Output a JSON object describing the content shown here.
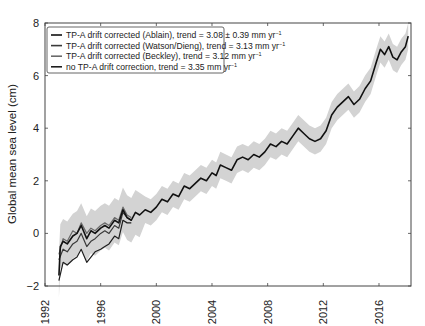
{
  "chart_data": {
    "type": "line",
    "title": "",
    "xlabel": "",
    "ylabel": "Global mean sea level (cm)",
    "xlim": [
      1992,
      2018.3
    ],
    "ylim": [
      -2,
      8
    ],
    "xticks": [
      1992,
      1996,
      2000,
      2004,
      2008,
      2012,
      2016
    ],
    "yticks": [
      -2,
      0,
      2,
      4,
      6,
      8
    ],
    "grid": false,
    "legend_position": "upper left",
    "series": [
      {
        "name": "TP-A drift corrected (Ablain), trend = 3.08 ± 0.39 mm yr⁻¹",
        "color": "#111111",
        "x": [
          1993.0,
          1993.1,
          1993.3,
          1993.6,
          1994.0,
          1994.3,
          1994.6,
          1995.0,
          1995.3,
          1995.6,
          1996.0,
          1996.3,
          1996.6,
          1997.0,
          1997.3,
          1997.6,
          1997.9,
          1998.2,
          1998.5,
          1998.8,
          1999.2,
          1999.6,
          2000.0,
          2000.4,
          2000.8,
          2001.2,
          2001.6,
          2002.0,
          2002.4,
          2002.8,
          2003.2,
          2003.6,
          2004.0,
          2004.3,
          2004.6,
          2005.0,
          2005.4,
          2005.8,
          2006.2,
          2006.6,
          2007.0,
          2007.4,
          2007.8,
          2008.2,
          2008.6,
          2009.0,
          2009.4,
          2009.8,
          2010.2,
          2010.6,
          2011.0,
          2011.4,
          2011.8,
          2012.2,
          2012.6,
          2013.0,
          2013.4,
          2013.8,
          2014.2,
          2014.6,
          2015.0,
          2015.4,
          2015.8,
          2016.1,
          2016.4,
          2016.7,
          2017.0,
          2017.3,
          2017.6,
          2017.9,
          2018.1
        ],
        "values": [
          -1.6,
          -0.5,
          -0.3,
          -0.4,
          -0.1,
          0.0,
          0.3,
          -0.2,
          0.1,
          0.0,
          0.2,
          0.3,
          0.2,
          0.5,
          0.4,
          0.9,
          0.6,
          0.5,
          0.8,
          0.7,
          0.9,
          0.8,
          1.0,
          1.3,
          1.2,
          1.5,
          1.4,
          1.8,
          1.7,
          1.9,
          2.1,
          2.0,
          2.3,
          2.2,
          2.6,
          2.5,
          2.4,
          2.8,
          2.9,
          2.8,
          3.0,
          2.9,
          3.1,
          3.4,
          3.3,
          3.5,
          3.4,
          3.7,
          4.0,
          3.8,
          3.6,
          3.5,
          3.6,
          3.9,
          4.5,
          4.8,
          5.0,
          5.2,
          4.9,
          5.1,
          5.5,
          5.8,
          6.5,
          7.0,
          6.8,
          7.1,
          6.7,
          6.6,
          6.9,
          7.1,
          7.5
        ],
        "uncertainty_band_cm": 0.5
      },
      {
        "name": "TP-A drift corrected (Watson/Dieng), trend = 3.13 mm yr⁻¹",
        "color": "#3a3a3a",
        "x": [
          1993.0,
          1993.3,
          1993.6,
          1994.0,
          1994.3,
          1994.6,
          1995.0,
          1995.3,
          1995.6,
          1996.0,
          1996.3,
          1996.6,
          1997.0,
          1997.3,
          1997.6,
          1997.9,
          1998.2
        ],
        "values": [
          -1.0,
          -0.6,
          -0.7,
          -0.4,
          -0.3,
          0.0,
          -0.5,
          -0.3,
          -0.2,
          0.0,
          0.1,
          0.0,
          0.3,
          0.2,
          0.8,
          0.6,
          0.5
        ]
      },
      {
        "name": "TP-A drift corrected (Beckley), trend = 3.12 mm yr⁻¹",
        "color": "#6a6a6a",
        "x": [
          1993.0,
          1993.3,
          1993.6,
          1994.0,
          1994.3,
          1994.6,
          1995.0,
          1995.3,
          1995.6,
          1996.0,
          1996.3,
          1996.6,
          1997.0,
          1997.3,
          1997.6,
          1997.9,
          1998.2
        ],
        "values": [
          -0.8,
          -0.2,
          -0.3,
          0.1,
          0.0,
          0.4,
          0.0,
          0.2,
          0.1,
          0.3,
          0.4,
          0.3,
          0.6,
          0.5,
          1.0,
          0.7,
          0.6
        ]
      },
      {
        "name": "no TP-A drift correction, trend = 3.35 mm yr⁻¹",
        "color": "#1e1e1e",
        "x": [
          1993.0,
          1993.3,
          1993.6,
          1994.0,
          1994.3,
          1994.6,
          1995.0,
          1995.3,
          1995.6,
          1996.0,
          1996.3,
          1996.6,
          1997.0,
          1997.3,
          1997.6,
          1997.9,
          1998.2
        ],
        "values": [
          -1.8,
          -1.1,
          -1.2,
          -1.0,
          -0.9,
          -0.6,
          -1.1,
          -0.9,
          -0.7,
          -0.6,
          -0.5,
          -0.4,
          -0.1,
          -0.2,
          0.5,
          0.4,
          0.4
        ]
      }
    ],
    "legend": [
      "TP-A drift corrected (Ablain), trend = 3.08 ± 0.39 mm yr⁻¹",
      "TP-A drift corrected (Watson/Dieng), trend = 3.13 mm yr⁻¹",
      "TP-A drift corrected (Beckley), trend = 3.12 mm yr⁻¹",
      "no TP-A drift correction, trend = 3.35 mm yr⁻¹"
    ]
  },
  "axes": {
    "ylabel": "Global mean sea level (cm)",
    "xtick_labels": [
      "1992",
      "1996",
      "2000",
      "2004",
      "2008",
      "2012",
      "2016"
    ],
    "ytick_labels": [
      "−2",
      "0",
      "2",
      "4",
      "6",
      "8"
    ]
  },
  "legend": {
    "items": [
      {
        "label": "TP-A drift corrected (Ablain), trend = 3.08 ± 0.39 mm yr",
        "sup": "−1",
        "color": "#111111"
      },
      {
        "label": "TP-A drift corrected (Watson/Dieng), trend = 3.13 mm yr",
        "sup": "−1",
        "color": "#3a3a3a"
      },
      {
        "label": "TP-A drift corrected (Beckley), trend = 3.12 mm yr",
        "sup": "−1",
        "color": "#6a6a6a"
      },
      {
        "label": "no TP-A drift correction, trend = 3.35 mm yr",
        "sup": "−1",
        "color": "#1e1e1e"
      }
    ]
  },
  "colors": {
    "band": "#d3d3d3",
    "axis": "#444444"
  }
}
